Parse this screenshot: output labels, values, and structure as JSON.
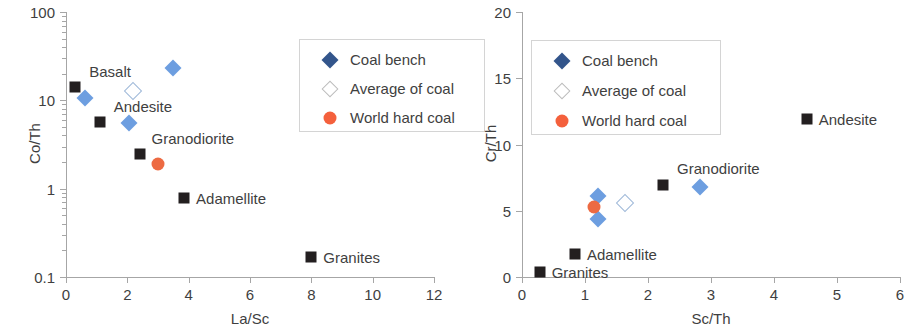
{
  "figure": {
    "panels": [
      "left",
      "right"
    ]
  },
  "legend": {
    "entries": [
      {
        "label": "Coal bench",
        "marker": "filled-diamond-icon",
        "color": "#33558b"
      },
      {
        "label": "Average of coal",
        "marker": "open-diamond-icon",
        "color": "#ffffff"
      },
      {
        "label": "World hard coal",
        "marker": "filled-circle-icon",
        "color": "#f4603c"
      }
    ]
  },
  "chart_data": [
    {
      "id": "left",
      "type": "scatter",
      "title": "",
      "xlabel": "La/Sc",
      "ylabel": "Co/Th",
      "xscale": "linear",
      "yscale": "log",
      "xlim": [
        0,
        12
      ],
      "ylim": [
        0.1,
        100
      ],
      "xticks": [
        "0",
        "2",
        "4",
        "6",
        "8",
        "10",
        "12"
      ],
      "xtick_values": [
        0,
        2,
        4,
        6,
        8,
        10,
        12
      ],
      "yticks": [
        "0.1",
        "1",
        "10",
        "100"
      ],
      "ytick_values": [
        0.1,
        1,
        10,
        100
      ],
      "grid": false,
      "legend_position": "upper right",
      "series": [
        {
          "name": "Coal bench",
          "marker": "filled-diamond-icon",
          "color": "#6d9ee0",
          "points": [
            {
              "x": 0.62,
              "y": 10.6
            },
            {
              "x": 2.05,
              "y": 5.6
            },
            {
              "x": 3.48,
              "y": 23.5
            }
          ]
        },
        {
          "name": "Average of coal",
          "marker": "open-diamond-icon",
          "color": "#ffffff",
          "points": [
            {
              "x": 2.2,
              "y": 12.8
            }
          ]
        },
        {
          "name": "World hard coal",
          "marker": "filled-circle-icon",
          "color": "#ed6a42",
          "points": [
            {
              "x": 3.0,
              "y": 1.9
            }
          ]
        },
        {
          "name": "Rock types",
          "marker": "filled-square-icon",
          "color": "#231f20",
          "points": [
            {
              "x": 0.3,
              "y": 14.0,
              "label": "Basalt",
              "label_dx": 14,
              "label_dy": -16
            },
            {
              "x": 1.1,
              "y": 5.7,
              "label": "Andesite",
              "label_dx": 14,
              "label_dy": -16
            },
            {
              "x": 2.4,
              "y": 2.5,
              "label": "Granodiorite",
              "label_dx": 12,
              "label_dy": -16
            },
            {
              "x": 3.85,
              "y": 0.78,
              "label": "Adamellite",
              "label_dx": 12,
              "label_dy": 0
            },
            {
              "x": 8.0,
              "y": 0.17,
              "label": "Granites",
              "label_dx": 12,
              "label_dy": 0
            }
          ]
        }
      ]
    },
    {
      "id": "right",
      "type": "scatter",
      "title": "",
      "xlabel": "Sc/Th",
      "ylabel": "Cr/Th",
      "xscale": "linear",
      "yscale": "linear",
      "xlim": [
        0,
        6
      ],
      "ylim": [
        0,
        20
      ],
      "xticks": [
        "0",
        "1",
        "2",
        "3",
        "4",
        "5",
        "6"
      ],
      "xtick_values": [
        0,
        1,
        2,
        3,
        4,
        5,
        6
      ],
      "yticks": [
        "0",
        "5",
        "10",
        "15",
        "20"
      ],
      "ytick_values": [
        0,
        5,
        10,
        15,
        20
      ],
      "grid": false,
      "legend_position": "upper left",
      "series": [
        {
          "name": "Coal bench",
          "marker": "filled-diamond-icon",
          "color": "#6d9ee0",
          "points": [
            {
              "x": 1.2,
              "y": 6.1
            },
            {
              "x": 1.2,
              "y": 4.35
            },
            {
              "x": 2.82,
              "y": 6.8
            }
          ]
        },
        {
          "name": "Average of coal",
          "marker": "open-diamond-icon",
          "color": "#ffffff",
          "points": [
            {
              "x": 1.63,
              "y": 5.6
            }
          ]
        },
        {
          "name": "World hard coal",
          "marker": "filled-circle-icon",
          "color": "#ed6a42",
          "points": [
            {
              "x": 1.14,
              "y": 5.25
            }
          ]
        },
        {
          "name": "Rock types",
          "marker": "filled-square-icon",
          "color": "#231f20",
          "points": [
            {
              "x": 4.52,
              "y": 11.9,
              "label": "Andesite",
              "label_dx": 12,
              "label_dy": 0
            },
            {
              "x": 2.24,
              "y": 6.95,
              "label": "Granodiorite",
              "label_dx": 14,
              "label_dy": -17
            },
            {
              "x": 0.84,
              "y": 1.75,
              "label": "Adamellite",
              "label_dx": 12,
              "label_dy": 0
            },
            {
              "x": 0.28,
              "y": 0.35,
              "label": "Granites",
              "label_dx": 12,
              "label_dy": 0
            }
          ]
        }
      ]
    }
  ]
}
